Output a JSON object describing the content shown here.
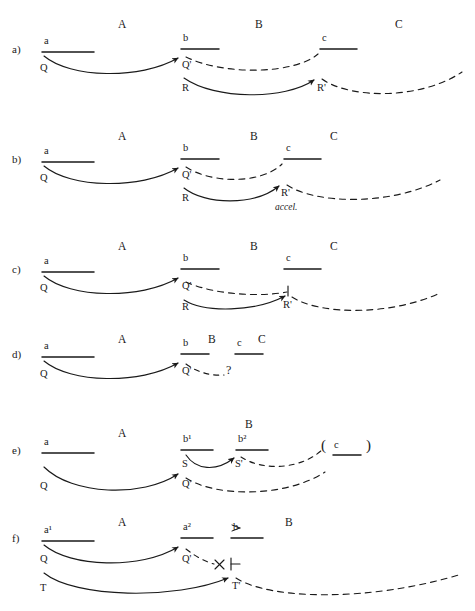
{
  "figure": {
    "type": "physics-signal-diagram",
    "width": 475,
    "height": 611,
    "ink_color": "#1a1a1a",
    "solid_style": "solid curved arrow",
    "dashed_style": "dashed curve"
  },
  "panels": [
    {
      "id": "a)",
      "regions": [
        {
          "label": "A",
          "x": 118,
          "y": 25
        },
        {
          "label": "B",
          "x": 255,
          "y": 25
        },
        {
          "label": "C",
          "x": 395,
          "y": 25
        }
      ],
      "bars": [
        {
          "label": "a",
          "x": 42,
          "y": 52,
          "w": 52,
          "label_dx": 2,
          "label_dy": -12
        },
        {
          "label": "b",
          "x": 181,
          "y": 49,
          "w": 38,
          "label_dx": 2,
          "label_dy": -12
        },
        {
          "label": "c",
          "x": 320,
          "y": 49,
          "w": 37,
          "label_dx": 2,
          "label_dy": -12
        }
      ],
      "signals": [
        {
          "name": "Q",
          "x": 40,
          "y": 72
        },
        {
          "name": "Q'",
          "x": 182,
          "y": 72
        },
        {
          "name": "R",
          "x": 182,
          "y": 92
        },
        {
          "name": "R'",
          "x": 317,
          "y": 92
        }
      ],
      "notes": []
    },
    {
      "id": "b)",
      "regions": [
        {
          "label": "A",
          "x": 118,
          "y": 138
        },
        {
          "label": "B",
          "x": 250,
          "y": 138
        },
        {
          "label": "C",
          "x": 330,
          "y": 138
        }
      ],
      "bars": [
        {
          "label": "a",
          "x": 42,
          "y": 162,
          "w": 52,
          "label_dx": 2,
          "label_dy": -12
        },
        {
          "label": "b",
          "x": 181,
          "y": 159,
          "w": 38,
          "label_dx": 2,
          "label_dy": -12
        },
        {
          "label": "c",
          "x": 284,
          "y": 159,
          "w": 37,
          "label_dx": 2,
          "label_dy": -12
        }
      ],
      "signals": [
        {
          "name": "Q",
          "x": 40,
          "y": 182
        },
        {
          "name": "Q'",
          "x": 182,
          "y": 182
        },
        {
          "name": "R",
          "x": 182,
          "y": 202
        },
        {
          "name": "R'",
          "x": 281,
          "y": 197
        }
      ],
      "notes": [
        {
          "text": "accel.",
          "x": 277,
          "y": 211,
          "style": "italic"
        }
      ]
    },
    {
      "id": "c)",
      "regions": [
        {
          "label": "A",
          "x": 118,
          "y": 248
        },
        {
          "label": "B",
          "x": 250,
          "y": 248
        },
        {
          "label": "C",
          "x": 330,
          "y": 248
        }
      ],
      "bars": [
        {
          "label": "a",
          "x": 42,
          "y": 272,
          "w": 52,
          "label_dx": 2,
          "label_dy": -12
        },
        {
          "label": "b",
          "x": 181,
          "y": 269,
          "w": 38,
          "label_dx": 2,
          "label_dy": -12
        },
        {
          "label": "c",
          "x": 284,
          "y": 269,
          "w": 37,
          "label_dx": 2,
          "label_dy": -12
        }
      ],
      "signals": [
        {
          "name": "Q",
          "x": 40,
          "y": 292
        },
        {
          "name": "Q'",
          "x": 182,
          "y": 292
        },
        {
          "name": "R",
          "x": 182,
          "y": 311
        },
        {
          "name": "R'",
          "x": 281,
          "y": 308
        }
      ],
      "notes": []
    },
    {
      "id": "d)",
      "regions": [
        {
          "label": "A",
          "x": 118,
          "y": 340
        },
        {
          "label": "B",
          "x": 208,
          "y": 340
        },
        {
          "label": "C",
          "x": 258,
          "y": 340
        }
      ],
      "bars": [
        {
          "label": "a",
          "x": 42,
          "y": 357,
          "w": 52,
          "label_dx": 2,
          "label_dy": -12
        },
        {
          "label": "b",
          "x": 181,
          "y": 354,
          "w": 28,
          "label_dx": 2,
          "label_dy": -12
        },
        {
          "label": "c",
          "x": 235,
          "y": 354,
          "w": 28,
          "label_dx": 2,
          "label_dy": -12
        }
      ],
      "signals": [
        {
          "name": "Q",
          "x": 40,
          "y": 378
        },
        {
          "name": "Q'",
          "x": 182,
          "y": 377
        }
      ],
      "notes": [
        {
          "text": "?",
          "x": 227,
          "y": 375,
          "style": "question"
        }
      ]
    },
    {
      "id": "e)",
      "regions": [
        {
          "label": "A",
          "x": 118,
          "y": 434
        },
        {
          "label": "B",
          "x": 245,
          "y": 425
        }
      ],
      "bars": [
        {
          "label": "a",
          "x": 42,
          "y": 453,
          "w": 52,
          "label_dx": 2,
          "label_dy": -12
        },
        {
          "label": "b¹",
          "x": 181,
          "y": 450,
          "w": 32,
          "label_dx": 2,
          "label_dy": -12
        },
        {
          "label": "b²",
          "x": 236,
          "y": 450,
          "w": 32,
          "label_dx": 2,
          "label_dy": -12
        }
      ],
      "signals": [
        {
          "name": "S",
          "x": 182,
          "y": 468
        },
        {
          "name": "S'",
          "x": 235,
          "y": 468
        },
        {
          "name": "Q",
          "x": 40,
          "y": 490
        },
        {
          "name": "Q'",
          "x": 182,
          "y": 489
        }
      ],
      "notes": [
        {
          "text": "(",
          "x": 323,
          "y": 452,
          "style": "paren"
        },
        {
          "text": "c",
          "x": 333,
          "y": 450,
          "style": "node"
        },
        {
          "text": ")",
          "x": 369,
          "y": 452,
          "style": "paren"
        }
      ],
      "bracket_bar": {
        "x": 333,
        "y": 455,
        "w": 28
      }
    },
    {
      "id": "f)",
      "regions": [
        {
          "label": "A",
          "x": 118,
          "y": 523
        },
        {
          "label": "B",
          "x": 285,
          "y": 523
        }
      ],
      "bars": [
        {
          "label": "a¹",
          "x": 42,
          "y": 541,
          "w": 52,
          "label_dx": 2,
          "label_dy": -12
        },
        {
          "label": "a²",
          "x": 181,
          "y": 538,
          "w": 32,
          "label_dx": 2,
          "label_dy": -12
        },
        {
          "label": "b",
          "x": 231,
          "y": 538,
          "w": 32,
          "label_dx": 2,
          "label_dy": -12
        }
      ],
      "signals": [
        {
          "name": "Q",
          "x": 40,
          "y": 563
        },
        {
          "name": "Q'",
          "x": 182,
          "y": 563
        },
        {
          "name": "T",
          "x": 40,
          "y": 592
        },
        {
          "name": "T'",
          "x": 232,
          "y": 590
        }
      ],
      "notes": [
        {
          "text": "×",
          "x": 217,
          "y": 566,
          "style": "blocked"
        },
        {
          "text": "⊣",
          "x": 233,
          "y": 566,
          "style": "endtick"
        },
        {
          "text": "≳",
          "x": 233,
          "y": 528,
          "style": "approx-above-b"
        }
      ]
    }
  ],
  "legend_semantics": {
    "solid_arrow": "outgoing signal (Q, R, S, T)",
    "dashed_curve": "returned / continuing signal (Q', R', S', T')",
    "cross_mark": "signal blocked",
    "question_mark": "signal fate unknown"
  }
}
